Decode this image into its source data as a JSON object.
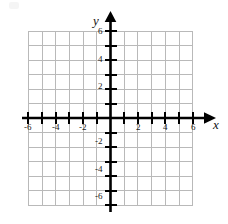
{
  "figure": {
    "kind": "cartesian-coordinate-plane",
    "background_color": "#ffffff",
    "grid_color": "#b9b9b9",
    "axis_color": "#000000",
    "label_color": "#1a1a1a"
  },
  "axes": {
    "x_name": "x",
    "y_name": "y",
    "x_name_left": 213,
    "x_name_top": 118,
    "y_name_left": 93,
    "y_name_top": 14
  },
  "chart_data": {
    "type": "scatter",
    "title": "",
    "xlabel": "x",
    "ylabel": "y",
    "xlim": [
      -6,
      6
    ],
    "ylim": [
      -6,
      6
    ],
    "grid": true,
    "grid_step": 1,
    "legend": "none",
    "x_tick_values": [
      -6,
      -4,
      -2,
      2,
      4,
      6
    ],
    "y_tick_values": [
      -6,
      -4,
      -2,
      2,
      4,
      6
    ],
    "x_tick_labels": [
      "-6",
      "-4",
      "-2",
      "2",
      "4",
      "6"
    ],
    "y_tick_labels": [
      "-6",
      "-4",
      "-2",
      "2",
      "4",
      "6"
    ],
    "x_minor_ticks": [
      -5,
      -3,
      -1,
      1,
      3,
      5
    ],
    "y_minor_ticks": [
      -5,
      -3,
      -1,
      1,
      3,
      5
    ],
    "series": [],
    "x": [],
    "values": [],
    "annotations": []
  },
  "x_axis_labels": [
    {
      "text": "-6",
      "left": 24,
      "top": 123
    },
    {
      "text": "-4",
      "left": 52,
      "top": 123
    },
    {
      "text": "-2",
      "left": 79,
      "top": 123
    },
    {
      "text": "2",
      "left": 136,
      "top": 123
    },
    {
      "text": "4",
      "left": 163,
      "top": 123
    },
    {
      "text": "6",
      "left": 191,
      "top": 123
    }
  ],
  "y_axis_labels": [
    {
      "text": "6",
      "left": 98,
      "top": 27
    },
    {
      "text": "4",
      "left": 98,
      "top": 55
    },
    {
      "text": "2",
      "left": 98,
      "top": 82
    },
    {
      "text": "-2",
      "left": 95,
      "top": 137
    },
    {
      "text": "-4",
      "left": 95,
      "top": 165
    },
    {
      "text": "-6",
      "left": 95,
      "top": 192
    }
  ]
}
